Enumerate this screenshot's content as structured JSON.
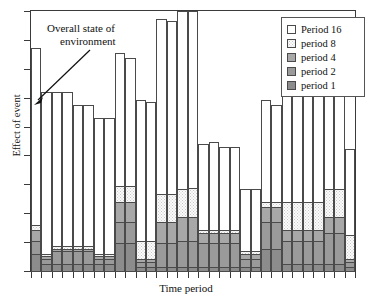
{
  "chart_data": {
    "type": "bar",
    "title": "",
    "subtitle": "",
    "xlabel": "Time period",
    "ylabel": "Effect of event",
    "grid": false,
    "stacked": true,
    "legend_position": "top-right",
    "ylim": [
      0,
      100
    ],
    "axis_tick_labels": {
      "x": [],
      "y": []
    },
    "annotations": [
      {
        "text_line1": "Overall state of",
        "text_line2": "environment",
        "points_to_bar": 1
      }
    ],
    "series": [
      {
        "name": "period 1",
        "color": "#8c8c8c",
        "values": [
          7,
          3,
          3,
          3,
          3,
          3,
          3,
          3,
          11,
          11,
          2,
          2,
          2,
          2,
          2,
          2,
          2,
          2,
          2,
          2,
          2,
          2,
          9,
          9,
          3,
          3,
          3,
          3,
          3,
          3,
          2
        ]
      },
      {
        "name": "period 2",
        "color": "#9a9a9a",
        "values": [
          5,
          2,
          5,
          5,
          5,
          5,
          2,
          2,
          8,
          8,
          2,
          2,
          9,
          9,
          11,
          11,
          9,
          9,
          9,
          9,
          3,
          3,
          10,
          10,
          9,
          9,
          9,
          9,
          12,
          12,
          2
        ]
      },
      {
        "name": "period 4",
        "color": "#a8a8a8",
        "values": [
          4,
          1,
          1,
          1,
          1,
          1,
          1,
          1,
          8,
          8,
          1,
          1,
          8,
          8,
          10,
          10,
          4,
          4,
          4,
          4,
          2,
          2,
          6,
          6,
          4,
          4,
          4,
          4,
          6,
          6,
          1
        ]
      },
      {
        "name": "period 8",
        "color": "#fbfbfb",
        "values": [
          2,
          1,
          1,
          1,
          1,
          1,
          1,
          1,
          6,
          6,
          7,
          7,
          11,
          11,
          12,
          12,
          1,
          1,
          1,
          1,
          1,
          1,
          2,
          2,
          11,
          11,
          11,
          11,
          11,
          11,
          9
        ]
      },
      {
        "name": "Period 16",
        "color": "#ffffff",
        "values": [
          68,
          62,
          59,
          59,
          54,
          54,
          52,
          52,
          51,
          49,
          54,
          53,
          67,
          66,
          75,
          74,
          33,
          34,
          32,
          32,
          24,
          24,
          39,
          37,
          48,
          48,
          41,
          41,
          40,
          40,
          33
        ]
      }
    ],
    "categories": [
      "1",
      "2",
      "3",
      "4",
      "5",
      "6",
      "7",
      "8",
      "9",
      "10",
      "11",
      "12",
      "13",
      "14",
      "15",
      "16",
      "17",
      "18",
      "19",
      "20",
      "21",
      "22",
      "23",
      "24",
      "25",
      "26",
      "27",
      "28",
      "29",
      "30",
      "31"
    ]
  },
  "legend": {
    "items": [
      {
        "label": "Period 16",
        "swatch": "white-swatch"
      },
      {
        "label": "period 8",
        "swatch": "dotted-swatch"
      },
      {
        "label": "period 4",
        "swatch": "gray-swatch"
      },
      {
        "label": "period 2",
        "swatch": "gray-swatch"
      },
      {
        "label": "period 1",
        "swatch": "gray-swatch"
      }
    ]
  },
  "annotation": {
    "line1": "Overall state of",
    "line2": "environment"
  },
  "axes": {
    "x_title": "Time period",
    "y_title": "Effect of event"
  }
}
